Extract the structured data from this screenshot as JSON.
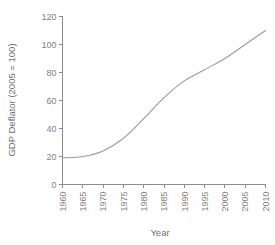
{
  "chart_data": {
    "type": "line",
    "title": "",
    "xlabel": "Year",
    "ylabel": "GDP Deflator (2005 = 100)",
    "x": [
      1960,
      1965,
      1970,
      1975,
      1980,
      1985,
      1990,
      1995,
      2000,
      2005,
      2010
    ],
    "values": [
      19,
      20,
      24,
      33,
      47,
      62,
      74,
      82,
      90,
      100,
      110
    ],
    "xlim": [
      1960,
      2010
    ],
    "ylim": [
      0,
      120
    ],
    "xticks": [
      "1960",
      "1965",
      "1970",
      "1975",
      "1980",
      "1985",
      "1990",
      "1995",
      "2000",
      "2005",
      "2010"
    ],
    "yticks": [
      "0",
      "20",
      "40",
      "60",
      "80",
      "100",
      "120"
    ],
    "grid": false,
    "legend": "none",
    "series": [
      {
        "name": "GDP Deflator",
        "color": "#9a9a9a",
        "values": [
          19,
          20,
          24,
          33,
          47,
          62,
          74,
          82,
          90,
          100,
          110
        ]
      }
    ]
  },
  "axes": {
    "y_title": "GDP Deflator (2005 = 100)",
    "x_title": "Year"
  },
  "colors": {
    "line": "#9a9a9a",
    "axis": "#8c8c8c",
    "text": "#808080",
    "background": "#ffffff"
  }
}
